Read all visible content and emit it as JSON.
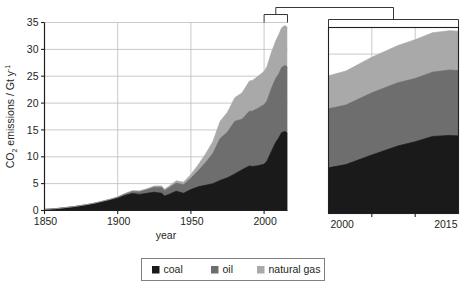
{
  "figure": {
    "axis_titles": {
      "x": "year",
      "y_prefix": "CO",
      "y_sub": "2",
      "y_mid": " emissions / Gt y",
      "y_sup": "-1",
      "y_full": "CO2 emissions / Gt y-1"
    },
    "main_axis": {
      "x_ticks": [
        "1850",
        "1900",
        "1950",
        "2000"
      ],
      "y_ticks": [
        "0",
        "5",
        "10",
        "15",
        "20",
        "25",
        "30",
        "35"
      ]
    },
    "inset_axis": {
      "x_ticks": [
        "2000",
        "2015"
      ]
    },
    "legend": {
      "items": [
        {
          "label": "coal",
          "color": "#1a1a1a"
        },
        {
          "label": "oil",
          "color": "#6e6e6e"
        },
        {
          "label": "natural gas",
          "color": "#a9a9a9"
        }
      ]
    }
  },
  "chart_data": {
    "type": "area",
    "stacked": true,
    "title": "",
    "xlabel": "year",
    "ylabel": "CO2 emissions / Gt y-1",
    "xlim": [
      1850,
      2016
    ],
    "ylim": [
      0,
      35
    ],
    "grid": true,
    "legend_position": "bottom",
    "x_ticks": [
      1850,
      1900,
      1950,
      2000
    ],
    "y_ticks": [
      0,
      5,
      10,
      15,
      20,
      25,
      30,
      35
    ],
    "inset": {
      "xlim": [
        2000,
        2015
      ],
      "ylim": [
        0,
        35
      ],
      "x_ticks": [
        2000,
        2015
      ],
      "note": "zoomed view of 2000-2015 region of the main panel"
    },
    "x": [
      1850,
      1855,
      1860,
      1865,
      1870,
      1875,
      1880,
      1885,
      1890,
      1895,
      1900,
      1905,
      1910,
      1915,
      1920,
      1925,
      1930,
      1932,
      1935,
      1940,
      1945,
      1950,
      1955,
      1960,
      1965,
      1970,
      1975,
      1980,
      1985,
      1990,
      1992,
      1995,
      2000,
      2002,
      2005,
      2008,
      2010,
      2012,
      2014,
      2015,
      2016
    ],
    "series": [
      {
        "name": "coal",
        "color": "#1a1a1a",
        "values": [
          0.2,
          0.3,
          0.4,
          0.55,
          0.7,
          0.9,
          1.1,
          1.35,
          1.65,
          1.95,
          2.3,
          2.8,
          3.15,
          3.0,
          3.2,
          3.4,
          3.2,
          2.7,
          3.0,
          3.6,
          3.2,
          3.9,
          4.4,
          4.7,
          5.0,
          5.6,
          6.1,
          6.8,
          7.6,
          8.3,
          8.2,
          8.3,
          8.6,
          9.2,
          11.0,
          12.7,
          13.5,
          14.5,
          14.7,
          14.6,
          14.4
        ],
        "unit": "Gt y-1"
      },
      {
        "name": "oil",
        "color": "#6e6e6e",
        "values": [
          0.0,
          0.0,
          0.01,
          0.02,
          0.03,
          0.04,
          0.06,
          0.08,
          0.11,
          0.15,
          0.2,
          0.3,
          0.45,
          0.55,
          0.7,
          0.95,
          1.1,
          1.0,
          1.2,
          1.5,
          1.6,
          2.1,
          3.0,
          4.2,
          5.6,
          7.8,
          8.5,
          9.8,
          9.4,
          10.2,
          10.3,
          10.6,
          11.1,
          11.2,
          11.7,
          11.9,
          11.9,
          12.1,
          12.3,
          12.3,
          12.3
        ],
        "unit": "Gt y-1"
      },
      {
        "name": "natural gas",
        "color": "#a9a9a9",
        "values": [
          0.0,
          0.0,
          0.0,
          0.0,
          0.0,
          0.0,
          0.0,
          0.01,
          0.01,
          0.02,
          0.03,
          0.05,
          0.08,
          0.1,
          0.14,
          0.2,
          0.28,
          0.26,
          0.32,
          0.42,
          0.48,
          0.7,
          1.1,
          1.6,
          2.2,
          3.2,
          3.7,
          4.4,
          4.9,
          5.6,
          5.7,
          5.9,
          6.2,
          6.4,
          6.7,
          7.0,
          7.3,
          7.4,
          7.4,
          7.4,
          7.4
        ],
        "unit": "Gt y-1"
      }
    ],
    "total_2015": 34.3
  }
}
